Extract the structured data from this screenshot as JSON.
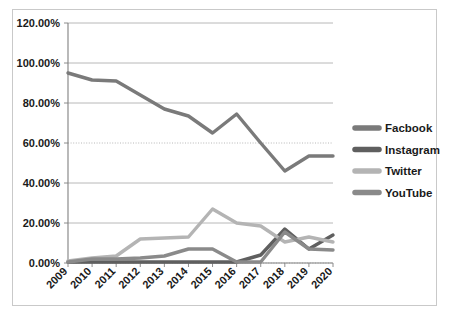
{
  "chart_data": {
    "type": "line",
    "title": "",
    "subtitle": "",
    "xlabel": "",
    "ylabel": "",
    "categories": [
      "2009",
      "2010",
      "2011",
      "2012",
      "2013",
      "2014",
      "2015",
      "2016",
      "2017",
      "2018",
      "2019",
      "2020"
    ],
    "x": [
      2009,
      2010,
      2011,
      2012,
      2013,
      2014,
      2015,
      2016,
      2017,
      2018,
      2019,
      2020
    ],
    "ylim": [
      0,
      120
    ],
    "xlim": [
      2009,
      2020
    ],
    "y_tick_labels": [
      "0.00%",
      "20.00%",
      "40.00%",
      "60.00%",
      "80.00%",
      "100.00%",
      "120.00%"
    ],
    "y_tick_values": [
      0,
      20,
      40,
      60,
      80,
      100,
      120
    ],
    "y_axis_unit": "%",
    "grid": true,
    "grid_axis": "y",
    "legend_position": "right",
    "series": [
      {
        "name": "Facbook",
        "color": "#7a7a7a",
        "values": [
          95.0,
          91.5,
          91.0,
          84.0,
          77.0,
          73.5,
          65.0,
          74.5,
          60.0,
          46.0,
          53.5,
          53.5
        ]
      },
      {
        "name": "Instagram",
        "color": "#5f5f5f",
        "values": [
          0.5,
          0.5,
          0.5,
          0.5,
          0.5,
          0.5,
          0.5,
          0.5,
          4.0,
          17.0,
          7.0,
          14.0
        ]
      },
      {
        "name": "Twitter",
        "color": "#b4b4b4",
        "values": [
          1.0,
          2.5,
          3.5,
          12.0,
          12.5,
          13.0,
          27.0,
          20.0,
          18.5,
          10.5,
          13.0,
          10.5
        ]
      },
      {
        "name": "YouTube",
        "color": "#8a8a8a",
        "values": [
          0.5,
          2.0,
          2.0,
          2.5,
          3.5,
          7.0,
          7.0,
          0.5,
          0.5,
          15.5,
          7.0,
          6.5
        ]
      }
    ]
  },
  "legend": {
    "entries": [
      {
        "label": "Facbook",
        "swatch_color": "#7a7a7a"
      },
      {
        "label": "Instagram",
        "swatch_color": "#5f5f5f"
      },
      {
        "label": "Twitter",
        "swatch_color": "#b4b4b4"
      },
      {
        "label": "YouTube",
        "swatch_color": "#8a8a8a"
      }
    ]
  },
  "axes": {
    "y_labels": [
      "120.00%",
      "100.00%",
      "80.00%",
      "60.00%",
      "40.00%",
      "20.00%",
      "0.00%"
    ],
    "x_labels": [
      "2009",
      "2010",
      "2011",
      "2012",
      "2013",
      "2014",
      "2015",
      "2016",
      "2017",
      "2018",
      "2019",
      "2020"
    ]
  },
  "colors": {
    "background": "#ffffff",
    "frame_border": "#c9c9c9",
    "gridline": "#b0b0b0",
    "axis_line": "#808080",
    "text": "#1a1a1a"
  }
}
